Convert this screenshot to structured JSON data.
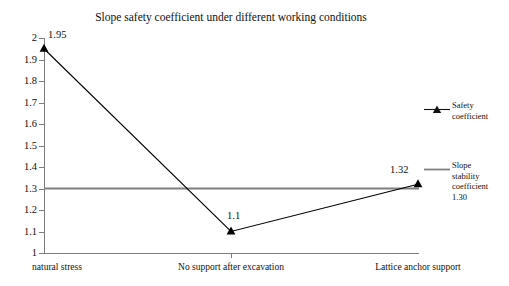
{
  "chart_data": {
    "type": "line",
    "title": "Slope safety coefficient under different working conditions",
    "xlabel": "",
    "ylabel": "",
    "categories": [
      "natural stress",
      "No support after excavation",
      "Lattice anchor support"
    ],
    "series": [
      {
        "name": "Safety coefficient",
        "values": [
          1.95,
          1.1,
          1.32
        ],
        "point_labels": [
          "1.95",
          "1.1",
          "1.32"
        ],
        "marker": "triangle",
        "color": "#000000"
      }
    ],
    "reference_lines": [
      {
        "name": "Slope stability coefficient",
        "value": 1.3,
        "value_label": "1.30",
        "color": "#808080"
      }
    ],
    "ylim": [
      1,
      2
    ],
    "ytick_step": 0.1,
    "yticks": [
      "1",
      "1.1",
      "1.2",
      "1.3",
      "1.4",
      "1.5",
      "1.6",
      "1.7",
      "1.8",
      "1.9",
      "2"
    ],
    "grid": false,
    "legend_position": "right"
  },
  "legend": {
    "entries": [
      {
        "marker": "triangle-line",
        "lines": [
          "Safety",
          "coefficient"
        ]
      },
      {
        "marker": "line",
        "lines": [
          "Slope",
          "stability",
          "coefficient",
          "1.30"
        ]
      }
    ]
  },
  "colors": {
    "series": "#000000",
    "reference_line": "#808080",
    "axis": "#7d7d7d",
    "text": "#111111",
    "background": "#ffffff"
  }
}
